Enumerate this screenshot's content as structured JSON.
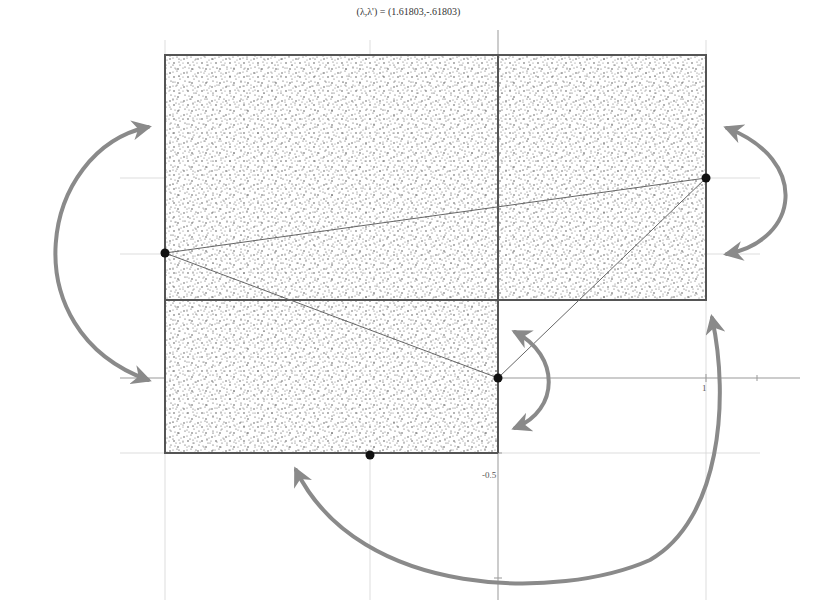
{
  "title": "(λ,λ') = (1.61803,-.61803)",
  "tick_labels": {
    "y_neg_half": "-0.5",
    "x_one": "1"
  },
  "colors": {
    "outline": "#555555",
    "stipple": "#444444",
    "arrow": "#8a8a8a",
    "grid": "#cccccc",
    "point": "#111111",
    "chord": "#666666"
  },
  "regions": [
    {
      "name": "upper-left-rectangle",
      "x": 165,
      "y": 55,
      "w": 333,
      "h": 245
    },
    {
      "name": "upper-right-rectangle",
      "x": 498,
      "y": 55,
      "w": 208,
      "h": 245
    },
    {
      "name": "lower-left-rectangle",
      "x": 165,
      "y": 300,
      "w": 333,
      "h": 153
    }
  ],
  "points": [
    {
      "name": "left-point",
      "x": 165,
      "y": 253
    },
    {
      "name": "right-point",
      "x": 706,
      "y": 178
    },
    {
      "name": "origin-point",
      "x": 498,
      "y": 378
    },
    {
      "name": "bottom-point",
      "x": 370,
      "y": 455
    }
  ],
  "chords": [
    {
      "from": "left-point",
      "to": "right-point"
    },
    {
      "from": "left-point",
      "to": "origin-point"
    },
    {
      "from": "origin-point",
      "to": "right-point"
    }
  ],
  "arrows": [
    {
      "name": "left-swap-arrow",
      "description": "curved double arrow between upper-left and lower-left strips"
    },
    {
      "name": "right-swap-arrow",
      "description": "curved double arrow on right side of upper-right rectangle"
    },
    {
      "name": "center-swap-arrow",
      "description": "small curved double arrow near origin"
    },
    {
      "name": "bottom-swap-arrow",
      "description": "large curved double arrow from bottom strip to right rectangle"
    }
  ]
}
